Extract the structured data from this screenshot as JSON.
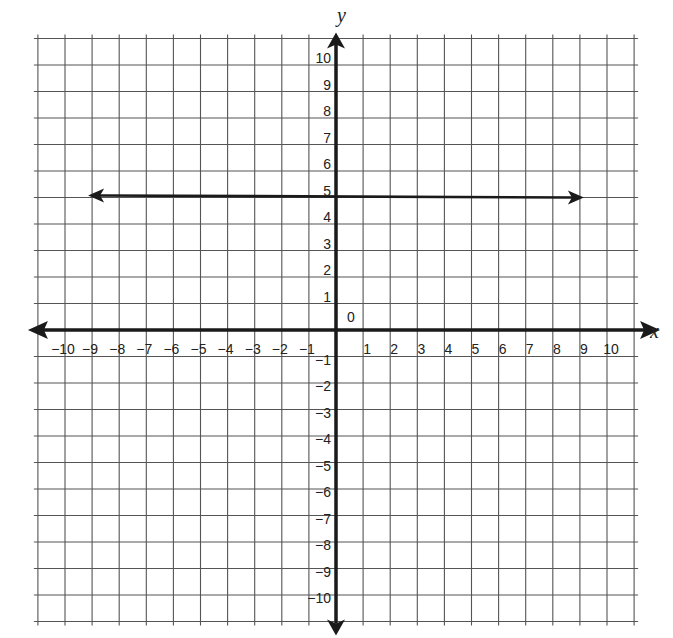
{
  "chart_data": {
    "type": "line",
    "title": "",
    "xlabel": "x",
    "ylabel": "y",
    "xlim": [
      -11,
      11
    ],
    "ylim": [
      -11,
      11
    ],
    "grid": true,
    "origin_label": "0",
    "x_ticks": [
      -10,
      -9,
      -8,
      -7,
      -6,
      -5,
      -4,
      -3,
      -2,
      -1,
      1,
      2,
      3,
      4,
      5,
      6,
      7,
      8,
      9,
      10
    ],
    "y_ticks": [
      10,
      9,
      8,
      7,
      6,
      5,
      4,
      3,
      2,
      1,
      -1,
      -2,
      -3,
      -4,
      -5,
      -6,
      -7,
      -8,
      -9,
      -10
    ],
    "series": [
      {
        "name": "horizontal line y = 5",
        "x": [
          -9,
          9
        ],
        "y": [
          5,
          5
        ],
        "arrows": "both"
      }
    ],
    "colors": {
      "grid": "#555555",
      "axis": "#1a1a1a",
      "line": "#1a1a1a"
    }
  }
}
